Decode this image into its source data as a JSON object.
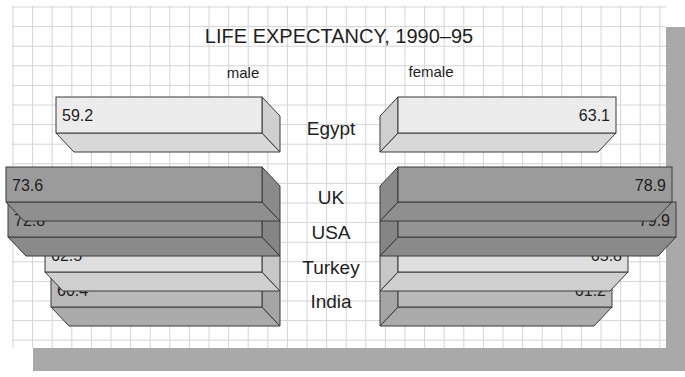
{
  "chart_data": {
    "type": "bar",
    "orientation": "horizontal-back-to-back",
    "title": "LIFE EXPECTANCY, 1990–95",
    "xlabel": "",
    "ylabel": "",
    "categories": [
      "Egypt",
      "UK",
      "USA",
      "Turkey",
      "India"
    ],
    "series": [
      {
        "name": "male",
        "values": [
          59.2,
          73.6,
          72.8,
          62.5,
          60.4
        ]
      },
      {
        "name": "female",
        "values": [
          63.1,
          78.9,
          79.9,
          65.8,
          61.2
        ]
      }
    ],
    "grid": true,
    "legend_position": "top (column headers)",
    "value_labels": true
  },
  "labels": {
    "title": "LIFE EXPECTANCY, 1990–95",
    "male": "male",
    "female": "female"
  },
  "colors": {
    "background": "#ffffff",
    "grid": "#d4d4d4",
    "shadow": "#a9a9a9",
    "outline": "#3a3a3a",
    "text": "#1e1e1e",
    "bars": {
      "Egypt": {
        "front": "#ececec",
        "side": "#cfcfcf",
        "bottom": "#d8d8d8"
      },
      "UK": {
        "front": "#9b9b9b",
        "side": "#8a8a8a",
        "bottom": "#8f8f8f"
      },
      "USA": {
        "front": "#949494",
        "side": "#858585",
        "bottom": "#8a8a8a"
      },
      "Turkey": {
        "front": "#dedede",
        "side": "#c7c7c7",
        "bottom": "#cfcfcf"
      },
      "India": {
        "front": "#b9b9b9",
        "side": "#a5a5a5",
        "bottom": "#ababab"
      }
    }
  }
}
